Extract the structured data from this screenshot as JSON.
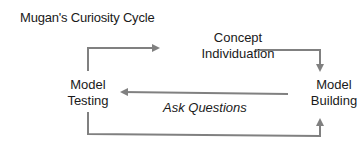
{
  "title": "Mugan's Curiosity Cycle",
  "nodes": {
    "concept": {
      "line1": "Concept",
      "line2": "Individuation"
    },
    "building": {
      "line1": "Model",
      "line2": "Building"
    },
    "testing": {
      "line1": "Model",
      "line2": "Testing"
    }
  },
  "edges": {
    "ask_questions": "Ask Questions"
  },
  "colors": {
    "arrow": "#808080",
    "text": "#1a1a1a"
  }
}
